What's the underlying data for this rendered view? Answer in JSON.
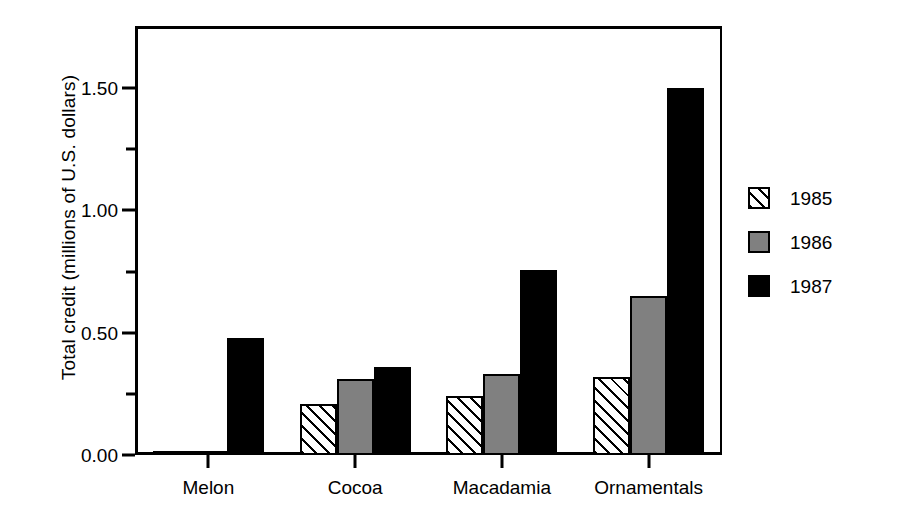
{
  "chart_data": {
    "type": "bar",
    "title": "",
    "xlabel": "",
    "ylabel": "Total credit (millions of U.S. dollars)",
    "categories": [
      "Melon",
      "Cocoa",
      "Macadamia",
      "Ornamentals"
    ],
    "series": [
      {
        "name": "1985",
        "values": [
          0.01,
          0.21,
          0.24,
          0.32
        ],
        "fill": "hatch-diagonal",
        "color": "#ffffff"
      },
      {
        "name": "1986",
        "values": [
          0.01,
          0.31,
          0.33,
          0.65
        ],
        "fill": "solid-gray",
        "color": "#808080"
      },
      {
        "name": "1987",
        "values": [
          0.48,
          0.36,
          0.755,
          1.5
        ],
        "fill": "solid-black",
        "color": "#000000"
      }
    ],
    "ylim": [
      0.0,
      1.75
    ],
    "ytick_values": [
      0.0,
      0.5,
      1.0,
      1.5
    ],
    "ytick_labels": [
      "0.00",
      "0.50",
      "1.00",
      "1.50"
    ],
    "yminor_tick_values": [
      0.25,
      0.75,
      1.25
    ],
    "grid": false,
    "legend_position": "right",
    "legend_entries": [
      "1985",
      "1986",
      "1987"
    ]
  },
  "legend": {
    "items": [
      {
        "label": "1985"
      },
      {
        "label": "1986"
      },
      {
        "label": "1987"
      }
    ]
  },
  "axes": {
    "y_title": "Total credit (millions of U.S. dollars)",
    "y_labels": [
      "1.50",
      "1.00",
      "0.50",
      "0.00"
    ],
    "x_labels": [
      "Melon",
      "Cocoa",
      "Macadamia",
      "Ornamentals"
    ]
  }
}
